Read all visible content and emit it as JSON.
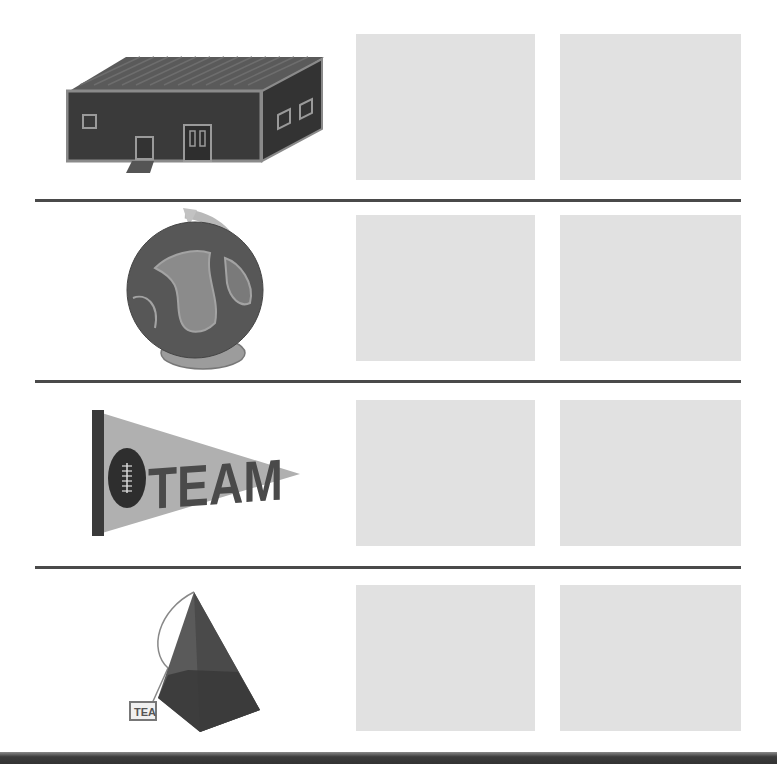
{
  "worksheet": {
    "rows": [
      {
        "picture": "building-image",
        "name": "building",
        "answer_boxes": [
          "",
          ""
        ]
      },
      {
        "picture": "globe-image",
        "name": "globe",
        "answer_boxes": [
          "",
          ""
        ]
      },
      {
        "picture": "pennant-image",
        "name": "pennant",
        "pennant_text": "TEAM",
        "answer_boxes": [
          "",
          ""
        ]
      },
      {
        "picture": "tea-bag-image",
        "name": "tea bag",
        "tag_text": "TEA",
        "answer_boxes": [
          "",
          ""
        ]
      }
    ]
  },
  "colors": {
    "box_fill": "#e1e1e1",
    "divider": "#4a4a4a",
    "bottom_band": "#333333"
  }
}
